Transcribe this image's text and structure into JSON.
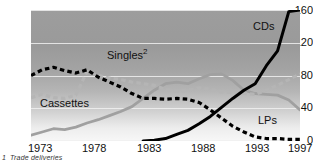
{
  "chart_data": {
    "type": "line",
    "title": "",
    "xlabel": "",
    "ylabel": "",
    "xlim": [
      1973,
      1997
    ],
    "ylim": [
      0,
      160
    ],
    "grid": true,
    "legend_position": "inline-annotations",
    "x_ticks": [
      "1973",
      "1978",
      "1983",
      "1988",
      "1993",
      "1997"
    ],
    "y_ticks": [
      "0",
      "40",
      "80",
      "120",
      "160"
    ],
    "x": [
      1973,
      1974,
      1975,
      1976,
      1977,
      1978,
      1979,
      1980,
      1981,
      1982,
      1983,
      1984,
      1985,
      1986,
      1987,
      1988,
      1989,
      1990,
      1991,
      1992,
      1993,
      1994,
      1995,
      1996,
      1997
    ],
    "series": [
      {
        "name": "CDs",
        "style": "solid",
        "color": "#000000",
        "values": [
          null,
          null,
          null,
          null,
          null,
          null,
          null,
          null,
          null,
          null,
          0,
          1,
          3,
          8,
          13,
          21,
          30,
          41,
          52,
          62,
          70,
          92,
          110,
          158,
          160
        ]
      },
      {
        "name": "Cassettes",
        "style": "solid",
        "color": "#a0a0a0",
        "values": [
          7,
          11,
          15,
          14,
          17,
          22,
          26,
          31,
          36,
          42,
          52,
          62,
          70,
          72,
          70,
          76,
          81,
          82,
          74,
          62,
          58,
          57,
          56,
          50,
          38
        ]
      },
      {
        "name": "Singles",
        "style": "dashed",
        "color": "#b5b5b5",
        "values": [
          53,
          57,
          53,
          52,
          56,
          85,
          80,
          77,
          75,
          72,
          70,
          68,
          63,
          61,
          62,
          65,
          63,
          60,
          59,
          58,
          57,
          62,
          68,
          75,
          82
        ],
        "footnote_marker": "2"
      },
      {
        "name": "LPs",
        "style": "dashed",
        "color": "#000000",
        "values": [
          80,
          87,
          90,
          86,
          83,
          87,
          78,
          72,
          66,
          58,
          52,
          52,
          51,
          52,
          51,
          47,
          38,
          28,
          18,
          11,
          5,
          3,
          3,
          2,
          2
        ]
      }
    ],
    "annotations": [
      {
        "text": "CDs",
        "x_pct": 84,
        "y_pct": 13
      },
      {
        "text": "Singles",
        "superscript": "2",
        "x_pct": 29,
        "y_pct": 32
      },
      {
        "text": "Cassettes",
        "x_pct": 5,
        "y_pct": 70
      },
      {
        "text": "LPs",
        "x_pct": 85,
        "y_pct": 82
      }
    ]
  },
  "footnote": {
    "marker": "1",
    "text": "Trade deliveries"
  }
}
